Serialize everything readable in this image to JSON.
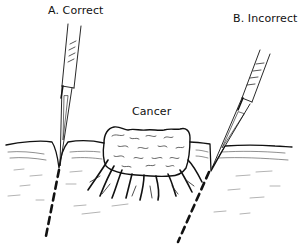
{
  "figure": {
    "type": "surgical-incision-illustration",
    "labels": {
      "correct": "A. Correct",
      "incorrect": "B. Incorrect",
      "lesion": "Cancer"
    },
    "colors": {
      "ink": "#111111",
      "background": "#ffffff"
    },
    "elements": {
      "left_scalpel": "scalpel-vertical-correct",
      "right_scalpel": "scalpel-angled-incorrect",
      "left_incision": "dashed-line-vertical",
      "right_incision": "dashed-line-angled-under-tumor"
    }
  }
}
